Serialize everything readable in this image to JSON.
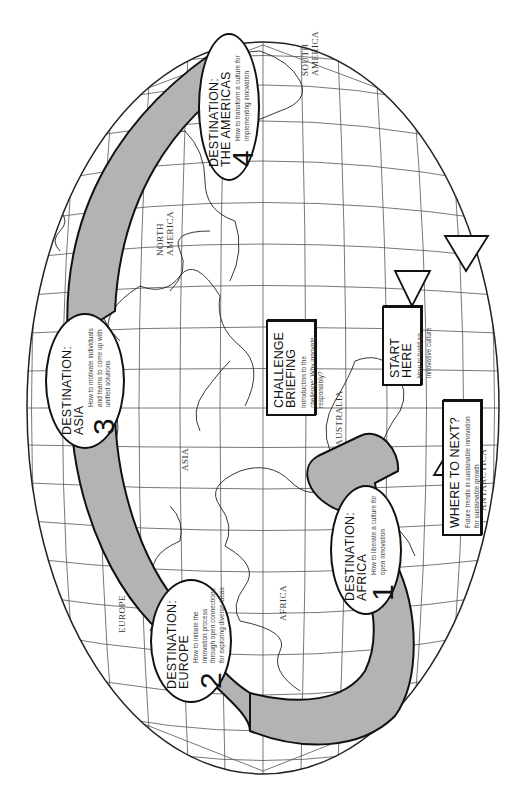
{
  "diagram": {
    "orientation": "rotated 90 degrees counter-clockwise",
    "colors": {
      "arrow_fill": "#b3b3b3",
      "outline": "#111111",
      "grid": "#444444",
      "background": "#ffffff"
    },
    "continent_labels": [
      {
        "id": "europe",
        "label": "EUROPE"
      },
      {
        "id": "asia",
        "label": "ASIA"
      },
      {
        "id": "africa",
        "label": "AFRICA"
      },
      {
        "id": "north_america",
        "label": "NORTH AMERICA"
      },
      {
        "id": "south_america",
        "label": "SOUTH AMERICA"
      },
      {
        "id": "australia",
        "label": "AUSTRALIA"
      },
      {
        "id": "antarctica",
        "label": "ANTARCTICA"
      }
    ],
    "start": {
      "title": "START HERE",
      "description": "How to build an innovative culture"
    },
    "challenge": {
      "title_line1": "CHALLENGE",
      "title_line2": "BRIEFING",
      "description": "Introduction to the challenge: Why innovate responsibly?"
    },
    "destinations": [
      {
        "number": "1",
        "title_line1": "DESTINATION:",
        "title_line2": "AFRICA",
        "description": "How to liberate a culture for open innovation"
      },
      {
        "number": "2",
        "title_line1": "DESTINATION:",
        "title_line2": "EUROPE",
        "description": "How to initiate the innovation process through open connections for exploring diverse ideas"
      },
      {
        "number": "3",
        "title_line1": "DESTINATION:",
        "title_line2": "ASIA",
        "description": "How to motivate individuals and teams to come up with unified solutions"
      },
      {
        "number": "4",
        "title_line1": "DESTINATION:",
        "title_line2": "THE AMERICAS",
        "description": "How to transform a culture for implementing innovation"
      }
    ],
    "end": {
      "title": "WHERE TO NEXT?",
      "description": "Future trends in sustainable innovation for sustainable growth"
    }
  }
}
